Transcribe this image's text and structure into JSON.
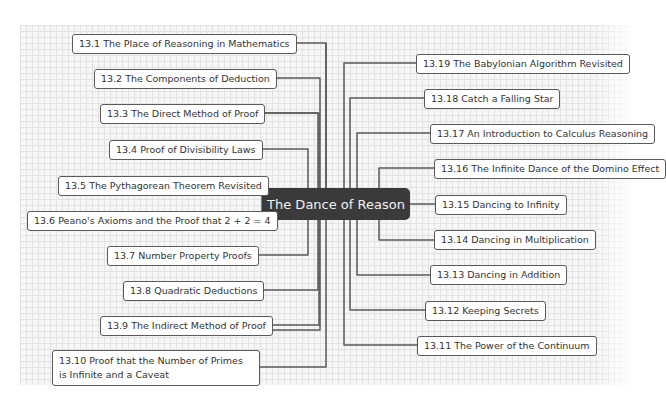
{
  "mindmap": {
    "center": {
      "label": "The Dance of Reason",
      "bg": "#3a3a3a"
    },
    "left_nodes": [
      {
        "label": "13.1 The Place of Reasoning in Mathematics"
      },
      {
        "label": "13.2 The Components of Deduction"
      },
      {
        "label": "13.3 The Direct Method of Proof"
      },
      {
        "label": "13.4 Proof of Divisibility Laws"
      },
      {
        "label": "13.5 The Pythagorean Theorem Revisited"
      },
      {
        "label": "13.6 Peano's Axioms and the Proof that 2 + 2 = 4"
      },
      {
        "label": "13.7 Number Property Proofs"
      },
      {
        "label": "13.8 Quadratic Deductions"
      },
      {
        "label": "13.9 The Indirect Method of Proof"
      },
      {
        "label": "13.10 Proof that the Number of Primes is Infinite and a Caveat"
      }
    ],
    "right_nodes": [
      {
        "label": "13.19 The Babylonian Algorithm Revisited"
      },
      {
        "label": "13.18 Catch a Falling Star"
      },
      {
        "label": "13.17 An Introduction to Calculus Reasoning"
      },
      {
        "label": "13.16 The Infinite Dance of the Domino Effect"
      },
      {
        "label": "13.15 Dancing to Infinity"
      },
      {
        "label": "13.14 Dancing in Multiplication"
      },
      {
        "label": "13.13 Dancing in Addition"
      },
      {
        "label": "13.12 Keeping Secrets"
      },
      {
        "label": "13.11 The Power of the Continuum"
      }
    ]
  }
}
